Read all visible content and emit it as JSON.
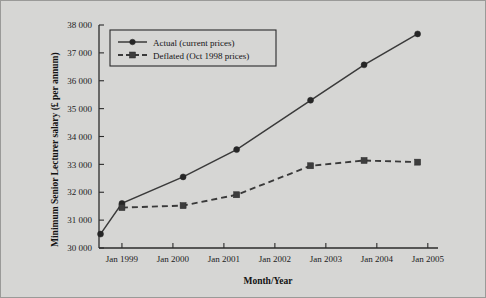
{
  "chart_data": {
    "type": "line",
    "title": "",
    "xlabel": "Month/Year",
    "ylabel": "Minimum Senior Lecturer salary (£ per annum)",
    "grid": false,
    "legend_position": "top-left",
    "ylim": [
      30000,
      38000
    ],
    "ytick_labels": [
      "38 000",
      "37 000",
      "36 000",
      "35 000",
      "34 000",
      "33 000",
      "32 000",
      "31 000",
      "30 000"
    ],
    "ytick_values": [
      38000,
      37000,
      36000,
      35000,
      34000,
      33000,
      32000,
      31000,
      30000
    ],
    "xtick_labels": [
      "Jan 1999",
      "Jan 2000",
      "Jan 2001",
      "Jan 2002",
      "Jan 2003",
      "Jan 2004",
      "Jan 2005"
    ],
    "xtick_values": [
      1999.0,
      2000.0,
      2001.0,
      2002.0,
      2003.0,
      2004.0,
      2005.0
    ],
    "xlim": [
      1998.55,
      2005.2
    ],
    "x": [
      1998.58,
      1999.0,
      2000.2,
      2001.25,
      2002.7,
      2003.75,
      2004.8
    ],
    "series": [
      {
        "name": "Actual (current prices)",
        "marker": "circle",
        "linestyle": "solid",
        "values": [
          30500,
          31600,
          32550,
          33530,
          35300,
          36570,
          37680
        ]
      },
      {
        "name": "Deflated (Oct 1998 prices)",
        "marker": "square",
        "linestyle": "dashed",
        "values": [
          null,
          31450,
          31520,
          31910,
          32950,
          33140,
          33080
        ]
      }
    ]
  },
  "legend": {
    "entries": [
      {
        "label": "Actual (current prices)"
      },
      {
        "label": "Deflated (Oct 1998 prices)"
      }
    ]
  },
  "axes": {
    "x_title": "Month/Year",
    "y_title": "Minimum Senior Lecturer salary (£ per annum)"
  }
}
